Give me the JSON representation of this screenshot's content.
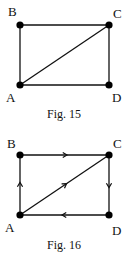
{
  "figures": [
    {
      "caption": "Fig. 15",
      "nodes": [
        {
          "id": "B",
          "label": "B"
        },
        {
          "id": "C",
          "label": "C"
        },
        {
          "id": "A",
          "label": "A"
        },
        {
          "id": "D",
          "label": "D"
        }
      ],
      "edges": [
        {
          "from": "B",
          "to": "C",
          "directed": false
        },
        {
          "from": "A",
          "to": "B",
          "directed": false
        },
        {
          "from": "A",
          "to": "C",
          "directed": false
        },
        {
          "from": "C",
          "to": "D",
          "directed": false
        },
        {
          "from": "A",
          "to": "D",
          "directed": false
        }
      ]
    },
    {
      "caption": "Fig. 16",
      "nodes": [
        {
          "id": "B",
          "label": "B"
        },
        {
          "id": "C",
          "label": "C"
        },
        {
          "id": "A",
          "label": "A"
        },
        {
          "id": "D",
          "label": "D"
        }
      ],
      "edges": [
        {
          "from": "A",
          "to": "B",
          "directed": true
        },
        {
          "from": "B",
          "to": "C",
          "directed": true
        },
        {
          "from": "A",
          "to": "C",
          "directed": true
        },
        {
          "from": "C",
          "to": "D",
          "directed": true
        },
        {
          "from": "D",
          "to": "A",
          "directed": true
        }
      ]
    }
  ]
}
